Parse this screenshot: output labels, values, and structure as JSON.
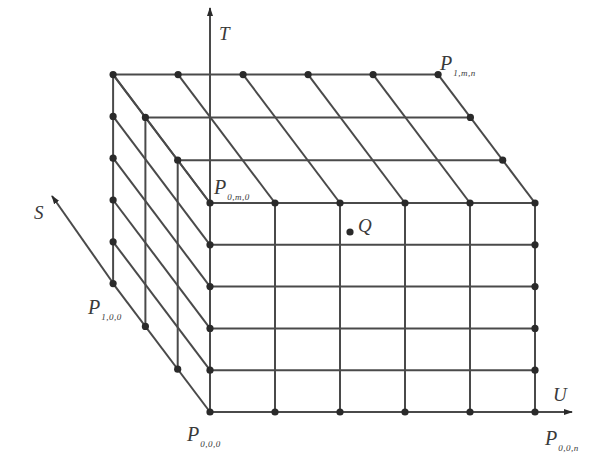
{
  "figure": {
    "grid": {
      "u_cells": 5,
      "t_cells": 5,
      "s_cells": 3,
      "front_origin": [
        210,
        412
      ],
      "u_step": [
        65,
        0
      ],
      "t_step": [
        0,
        -41.8
      ],
      "s_step": [
        -32.3,
        -42.8
      ]
    },
    "colors": {
      "line": "#4a4a4a",
      "dot": "#2a2a2a",
      "text": "#3a3a3a",
      "background": "#ffffff"
    },
    "axes": {
      "T": {
        "label": "T",
        "from": [
          210,
          412
        ],
        "to": [
          210,
          8
        ],
        "label_pos": [
          219,
          24
        ]
      },
      "U": {
        "label": "U",
        "from": [
          535,
          412
        ],
        "to": [
          572,
          412
        ],
        "label_pos": [
          553,
          385
        ]
      },
      "S": {
        "label": "S",
        "from": [
          113,
          283
        ],
        "to": [
          52,
          196
        ],
        "label_pos": [
          34,
          203
        ]
      }
    },
    "point_labels": [
      {
        "id": "p_1mn",
        "main": "P",
        "sub": "1,m,n",
        "pos": [
          440,
          53
        ]
      },
      {
        "id": "p_0m0",
        "main": "P",
        "sub": "0,m,0",
        "pos": [
          214,
          177
        ]
      },
      {
        "id": "p_100",
        "main": "P",
        "sub": "1,0,0",
        "pos": [
          88,
          297
        ]
      },
      {
        "id": "p_000",
        "main": "P",
        "sub": "0,0,0",
        "pos": [
          187,
          424
        ]
      },
      {
        "id": "p_00n",
        "main": "P",
        "sub": "0,0,n",
        "pos": [
          545,
          428
        ]
      }
    ],
    "special_point": {
      "label": "Q",
      "dot": [
        350,
        232
      ],
      "label_pos": [
        358,
        216
      ]
    }
  }
}
